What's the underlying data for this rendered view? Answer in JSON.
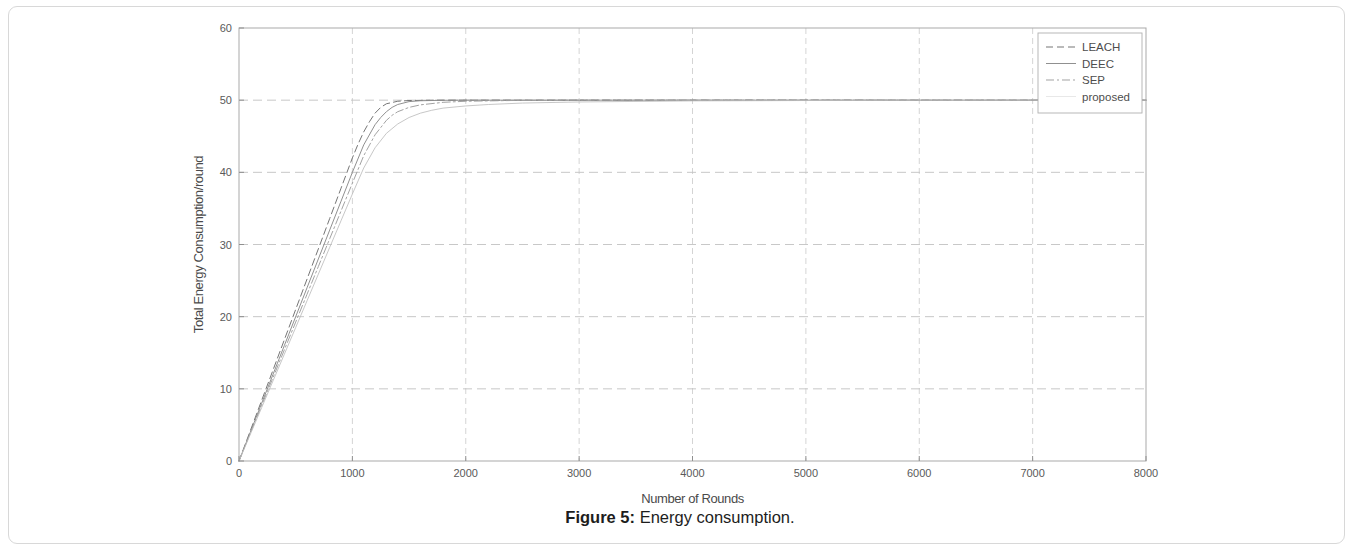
{
  "figure": {
    "caption_label": "Figure 5:",
    "caption_text": "Energy consumption."
  },
  "chart_data": {
    "type": "line",
    "title": "",
    "xlabel": "Number of Rounds",
    "ylabel": "Total Energy Consumption/round",
    "xlim": [
      0,
      8000
    ],
    "ylim": [
      0,
      60
    ],
    "xticks": [
      0,
      1000,
      2000,
      3000,
      4000,
      5000,
      6000,
      7000,
      8000
    ],
    "yticks": [
      0,
      10,
      20,
      30,
      40,
      50,
      60
    ],
    "xtick_labels": [
      "0",
      "1000",
      "2000",
      "3000",
      "4000",
      "5000",
      "6000",
      "7000",
      "8000"
    ],
    "ytick_labels": [
      "0",
      "10",
      "20",
      "30",
      "40",
      "50",
      "60"
    ],
    "grid": true,
    "grid_style": "dashed",
    "legend_position": "top-right-inside",
    "series": [
      {
        "name": "LEACH",
        "style": "dashed",
        "color": "#6e6e6e",
        "x": [
          0,
          100,
          200,
          300,
          400,
          500,
          600,
          700,
          800,
          900,
          1000,
          1050,
          1100,
          1150,
          1200,
          1250,
          1300,
          1400,
          1500,
          1700,
          2000,
          3000,
          4000,
          5000,
          6000,
          7000,
          8000
        ],
        "y": [
          0,
          4.2,
          8.4,
          12.6,
          16.8,
          21.0,
          25.2,
          29.4,
          33.6,
          37.8,
          42.0,
          43.9,
          45.6,
          47.0,
          48.2,
          49.0,
          49.5,
          49.85,
          49.95,
          50.0,
          50.0,
          50.0,
          50.0,
          50.0,
          50.0,
          50.0,
          50.0
        ]
      },
      {
        "name": "DEEC",
        "style": "solid",
        "color": "#8a8a8a",
        "x": [
          0,
          100,
          200,
          300,
          400,
          500,
          600,
          700,
          800,
          900,
          1000,
          1100,
          1200,
          1250,
          1300,
          1350,
          1400,
          1500,
          1600,
          1800,
          2000,
          3000,
          4000,
          5000,
          6000,
          7000,
          8000
        ],
        "y": [
          0,
          4.0,
          8.0,
          12.0,
          16.0,
          20.0,
          24.0,
          28.0,
          32.0,
          36.0,
          40.0,
          43.8,
          46.6,
          47.6,
          48.4,
          49.0,
          49.4,
          49.8,
          49.92,
          49.98,
          50.0,
          50.0,
          50.0,
          50.0,
          50.0,
          50.0,
          50.0
        ]
      },
      {
        "name": "SEP",
        "style": "dashdot",
        "color": "#9d9d9d",
        "x": [
          0,
          100,
          200,
          300,
          400,
          500,
          600,
          700,
          800,
          900,
          1000,
          1100,
          1200,
          1300,
          1350,
          1400,
          1500,
          1600,
          1800,
          2000,
          2400,
          3000,
          4000,
          5000,
          6000,
          7000,
          8000
        ],
        "y": [
          0,
          3.85,
          7.7,
          11.55,
          15.4,
          19.25,
          23.1,
          26.95,
          30.8,
          34.65,
          38.5,
          42.3,
          45.2,
          47.2,
          47.9,
          48.4,
          49.0,
          49.35,
          49.7,
          49.85,
          49.95,
          50.0,
          50.0,
          50.0,
          50.0,
          50.0,
          50.0
        ]
      },
      {
        "name": "proposed",
        "style": "faint",
        "color": "#bdbdbd",
        "x": [
          0,
          100,
          200,
          300,
          400,
          500,
          600,
          700,
          800,
          900,
          1000,
          1100,
          1200,
          1300,
          1400,
          1500,
          1600,
          1700,
          1800,
          2000,
          2200,
          2500,
          3000,
          4000,
          5000,
          6000,
          7000,
          8000
        ],
        "y": [
          0,
          3.7,
          7.4,
          11.1,
          14.8,
          18.5,
          22.2,
          25.9,
          29.6,
          33.3,
          37.0,
          40.6,
          43.4,
          45.4,
          46.7,
          47.6,
          48.2,
          48.6,
          48.9,
          49.2,
          49.4,
          49.6,
          49.75,
          49.9,
          49.95,
          50.0,
          50.0,
          50.0
        ]
      }
    ],
    "legend_entries": [
      "LEACH",
      "DEEC",
      "SEP",
      "proposed"
    ]
  }
}
